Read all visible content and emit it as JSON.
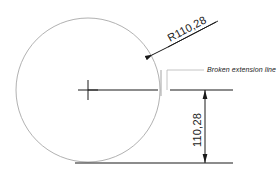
{
  "drawing": {
    "title": "Broken extension line dimensioning example",
    "background_color": "#ffffff",
    "object_line_color": "#a8a8a8",
    "dimension_line_color": "#1a1a1a",
    "text_color": "#1a1a1a",
    "leader_line_color": "#b5b5b5"
  },
  "circle": {
    "name": "main-circle",
    "center_x": 88,
    "center_y": 90,
    "radius": 72
  },
  "center_mark": {
    "name": "center-mark",
    "x": 88,
    "y": 90,
    "arm": 10
  },
  "radius_dimension": {
    "label": "R110,28",
    "value": "110,28",
    "prefix": "R",
    "rotation_deg": -28,
    "leader_start_x": 90,
    "leader_start_y": 88,
    "leader_end_x": 159,
    "leader_end_y": 52,
    "text_x": 170,
    "text_y": 42
  },
  "vertical_dimension": {
    "label": "110,28",
    "value": "110,28",
    "rotation_deg": -90,
    "line_x": 205,
    "top_y": 90,
    "bottom_y": 163,
    "text_x": 201,
    "text_y": 130
  },
  "extension_lines": {
    "upper": {
      "name": "upper-extension-line",
      "y": 90,
      "x_start": 170,
      "x_end": 233,
      "break_gap_start": 160,
      "break_gap_end": 170
    },
    "lower": {
      "name": "lower-extension-line",
      "y": 163,
      "x_start": 75,
      "x_end": 233
    }
  },
  "radius_line": {
    "name": "horizontal-radius-line",
    "x_start": 88,
    "x_end": 158,
    "y": 90
  },
  "break_tick": {
    "name": "break-tick",
    "x": 161,
    "y_top": 70,
    "y_bottom": 96
  },
  "note": {
    "text": "Broken extension line",
    "text_x": 207,
    "text_y": 72,
    "leader_x_start": 167,
    "leader_x_end": 204,
    "leader_y": 70,
    "leader_drop_y": 90
  }
}
